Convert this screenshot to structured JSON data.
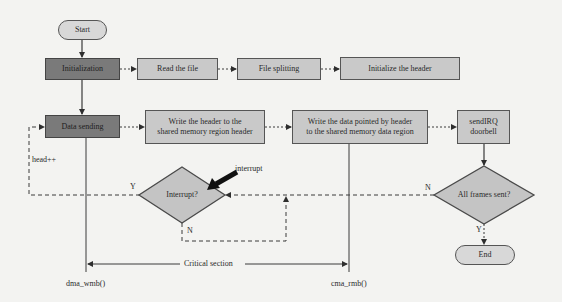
{
  "diagram": {
    "type": "flowchart",
    "nodes": {
      "start": "Start",
      "initialization": "Initialization",
      "read_file": "Read the file",
      "file_splitting": "File splitting",
      "init_header": "Initialize the header",
      "data_sending": "Data sending",
      "write_header_line1": "Write the header to the",
      "write_header_line2": "shared memory region header",
      "write_data_line1": "Write the data pointed by header",
      "write_data_line2": "to the shared memory data region",
      "send_irq_line1": "sendIRQ",
      "send_irq_line2": "doorbell",
      "interrupt_decision": "Interrupt?",
      "all_frames_decision": "All frames sent?",
      "end": "End"
    },
    "labels": {
      "head_increment": "head++",
      "interrupt_arrow": "interrupt",
      "interrupt_yes": "Y",
      "interrupt_no": "N",
      "frames_no": "N",
      "frames_yes": "Y",
      "critical_section": "Critical section",
      "dma_wmb": "dma_wmb()",
      "cma_rmb": "cma_rmb()"
    },
    "colors": {
      "background": "#f3f3f1",
      "dark_box": "#7a7a7a",
      "light_box": "#c9c9c9",
      "decision": "#c4c4c4",
      "line": "#3a3a3a"
    }
  }
}
